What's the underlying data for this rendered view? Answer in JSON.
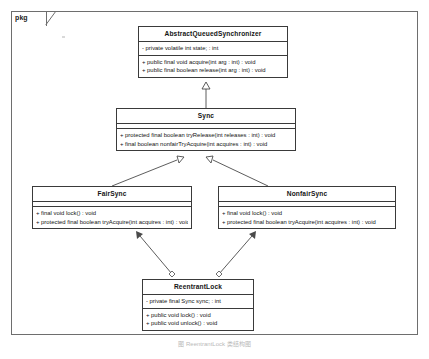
{
  "diagram": {
    "frame_label": "pkg",
    "caption": "图  ReentrantLock 类结构图",
    "colors": {
      "border": "#3a3a3a",
      "frame_border": "#6e6e6e",
      "text": "#141414",
      "background": "#ffffff",
      "connector": "#4a4a4a"
    }
  },
  "classes": {
    "abstract_queued_synchronizer": {
      "name": "AbstractQueuedSynchronizer",
      "attributes": [
        "- private volatile int state; : int"
      ],
      "operations": [
        "+ public final void acquire(int arg : int) : void",
        "+ public final boolean release(int arg : int) : void"
      ]
    },
    "sync": {
      "name": "Sync",
      "attributes": [],
      "operations": [
        "+ protected final boolean tryRelease(int releases : int) : void",
        "+ final boolean nonfairTryAcquire(int acquires : int) : void"
      ]
    },
    "fair_sync": {
      "name": "FairSync",
      "attributes": [],
      "operations": [
        "+ final void lock() : void",
        "+ protected final boolean tryAcquire(int acquires : int) : void"
      ]
    },
    "nonfair_sync": {
      "name": "NonfairSync",
      "attributes": [],
      "operations": [
        "+ final void lock() : void",
        "+ protected final boolean tryAcquire(int acquires : int) : void"
      ]
    },
    "reentrant_lock": {
      "name": "ReentrantLock",
      "attributes": [
        "- private final Sync sync; : int"
      ],
      "operations": [
        "+ public void lock() : void",
        "+ public void unlock() : void"
      ]
    }
  },
  "relationships": [
    {
      "id": "gen-sync-aqs",
      "type": "generalization",
      "from": "Sync",
      "to": "AbstractQueuedSynchronizer"
    },
    {
      "id": "gen-fair-sync",
      "type": "generalization",
      "from": "FairSync",
      "to": "Sync"
    },
    {
      "id": "gen-nonfair-sync",
      "type": "generalization",
      "from": "NonfairSync",
      "to": "Sync"
    },
    {
      "id": "assoc-rl-fair",
      "type": "association",
      "from": "ReentrantLock",
      "to": "FairSync"
    },
    {
      "id": "assoc-rl-nonfair",
      "type": "association",
      "from": "ReentrantLock",
      "to": "NonfairSync"
    }
  ]
}
